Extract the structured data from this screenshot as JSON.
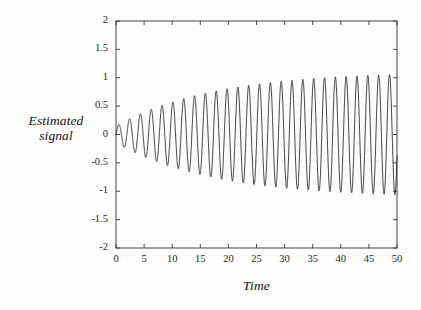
{
  "chart_data": {
    "type": "line",
    "title": "",
    "xlabel": "Time",
    "ylabel_line1": "Estimated",
    "ylabel_line2": "signal",
    "xlim": [
      0,
      50
    ],
    "ylim": [
      -2,
      2
    ],
    "xticks": [
      0,
      5,
      10,
      15,
      20,
      25,
      30,
      35,
      40,
      45,
      50
    ],
    "xtick_labels": [
      "0",
      "5",
      "10",
      "15",
      "20",
      "25",
      "30",
      "35",
      "40",
      "45",
      "50"
    ],
    "yticks": [
      -2,
      -1.5,
      -1,
      -0.5,
      0,
      0.5,
      1,
      1.5,
      2
    ],
    "ytick_labels": [
      "2",
      "1.5",
      "1",
      "0.5",
      "0",
      "-0.5",
      "-1",
      "-1.5",
      "-2"
    ],
    "grid": false,
    "legend": false,
    "legend_position": "none",
    "line_color": "#222222",
    "frame_color": "#333333",
    "background_color": "#fdfdfc",
    "series": [
      {
        "name": "Estimated signal",
        "model": "amplitude_modulated_sine",
        "amplitude_start": 0.15,
        "amplitude_end": 1.06,
        "envelope_saturation": 0.93,
        "angular_frequency": 3.26,
        "phase": 0.0,
        "x_start": 0,
        "x_end": 50,
        "samples": 2600
      }
    ]
  },
  "figure": {
    "plot_area": {
      "left": 116,
      "top": 21,
      "right": 397,
      "bottom": 248
    },
    "tick_length": 4
  }
}
